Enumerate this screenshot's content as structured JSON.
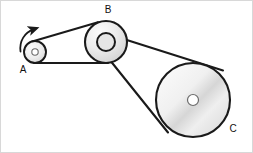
{
  "figure": {
    "background_color": "#ffffff",
    "border_color": "#d8d8d8",
    "line_color": "#1a1a1a",
    "pulley_fill_light": "#f2f2f2",
    "pulley_fill_mid": "#d9d9d9",
    "hub_fill": "#ffffff"
  },
  "labels": {
    "a": "A",
    "b": "B",
    "c": "C"
  },
  "pulleys": [
    {
      "id": "A",
      "label": "A",
      "cx": 34,
      "cy": 51,
      "radius": 11,
      "hub_radius": 3.2,
      "label_x": 22,
      "label_y": 72
    },
    {
      "id": "B",
      "label": "B",
      "cx": 105,
      "cy": 41,
      "radius": 21,
      "hub_radius": 9,
      "label_x": 107,
      "label_y": 12
    },
    {
      "id": "C",
      "label": "C",
      "cx": 192,
      "cy": 99,
      "radius": 37,
      "hub_radius": 5.5,
      "label_x": 232,
      "label_y": 131
    }
  ],
  "belts": [
    {
      "id": "belt-a-b",
      "from": "A",
      "to": "B",
      "description": "Outer belt wrapping pulley A rim and pulley B outer rim"
    },
    {
      "id": "belt-b-c",
      "from": "B-hub",
      "to": "C",
      "description": "Inner belt from pulley B hub to pulley C rim"
    }
  ],
  "rotation_arrow": {
    "id": "rotation-arrow-a",
    "attached_to": "A",
    "direction": "counterclockwise-indicator",
    "tip_x": 35,
    "tip_y": 27
  }
}
